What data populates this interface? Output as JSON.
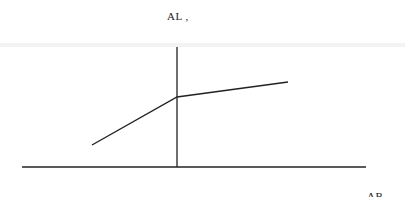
{
  "chart_data": {
    "type": "line",
    "title": "",
    "ylabel": "AL ,",
    "xlabel": "AB",
    "grid": false,
    "legend": null,
    "axes": {
      "x_axis": {
        "x1": 22,
        "x2": 366,
        "y": 167
      },
      "y_axis": {
        "x": 177,
        "y1": 47,
        "y2": 167
      }
    },
    "series": [
      {
        "name": "curve",
        "points_px": [
          [
            92,
            145
          ],
          [
            177,
            97
          ],
          [
            288,
            82
          ]
        ],
        "description": "piecewise linear: steeper slope left of the vertical axis, shallower slope to the right (kink at the axis)"
      }
    ]
  },
  "labels": {
    "y_axis_label": "AL ,",
    "x_axis_label": "AB"
  }
}
